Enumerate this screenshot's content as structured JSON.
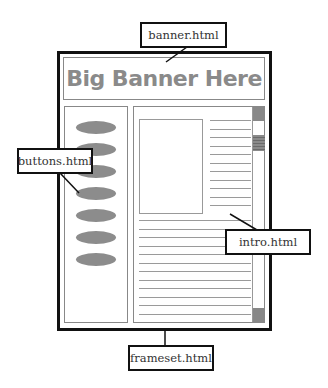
{
  "diagram": {
    "type": "frameset-layout",
    "labels": {
      "banner": "banner.html",
      "buttons": "buttons.html",
      "intro": "intro.html",
      "frameset": "frameset.html"
    },
    "banner_text": "Big Banner Here",
    "button_count": 7,
    "colors": {
      "outline": "#111111",
      "frame_border": "#888888",
      "banner_text": "#8a8a8a",
      "button_fill": "#8c8c8c",
      "scroll_fill": "#888888"
    }
  }
}
